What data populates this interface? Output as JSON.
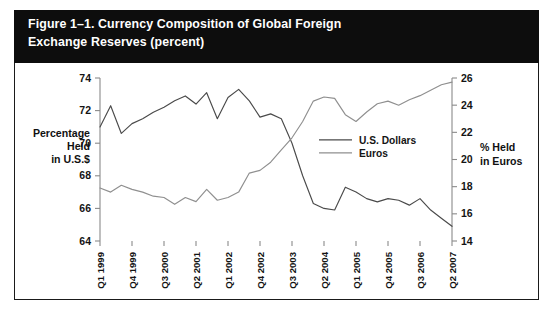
{
  "figure": {
    "title_line1": "Figure 1–1. Currency Composition of Global Foreign",
    "title_line2": "Exchange Reserves (percent)",
    "title_bg": "#0d0d0d",
    "title_color": "#ffffff"
  },
  "axis_titles": {
    "left_line1": "Percentage",
    "left_line2": "Held",
    "left_line3": "in U.S.$",
    "right_line1": "% Held",
    "right_line2": "in Euros"
  },
  "legend": {
    "items": [
      {
        "label": "U.S. Dollars",
        "color": "#4a4a4a"
      },
      {
        "label": "Euros",
        "color": "#8f8f8f"
      }
    ]
  },
  "chart_data": {
    "type": "line",
    "title": "Figure 1–1. Currency Composition of Global Foreign Exchange Reserves (percent)",
    "xlabel": "",
    "ylabel": "Percentage Held in U.S.$",
    "y2label": "% Held in Euros",
    "grid": false,
    "legend_position": "center",
    "ylim": [
      64,
      74
    ],
    "y2lim": [
      14,
      26
    ],
    "yticks": [
      64,
      66,
      68,
      70,
      72,
      74
    ],
    "y2ticks": [
      14,
      16,
      18,
      20,
      22,
      24,
      26
    ],
    "x": [
      "Q1 1999",
      "Q2 1999",
      "Q3 1999",
      "Q4 1999",
      "Q1 2000",
      "Q2 2000",
      "Q3 2000",
      "Q4 2000",
      "Q1 2001",
      "Q2 2001",
      "Q3 2001",
      "Q4 2001",
      "Q1 2002",
      "Q2 2002",
      "Q3 2002",
      "Q4 2002",
      "Q1 2003",
      "Q2 2003",
      "Q3 2003",
      "Q4 2003",
      "Q1 2004",
      "Q2 2004",
      "Q3 2004",
      "Q4 2004",
      "Q1 2005",
      "Q2 2005",
      "Q3 2005",
      "Q4 2005",
      "Q1 2006",
      "Q2 2006",
      "Q3 2006",
      "Q4 2006",
      "Q1 2007",
      "Q2 2007"
    ],
    "xtick_labels": [
      "Q1 1999",
      "Q4 1999",
      "Q3 2000",
      "Q2 2001",
      "Q1 2002",
      "Q4 2002",
      "Q3 2003",
      "Q2 2004",
      "Q1 2005",
      "Q4 2005",
      "Q3 2006",
      "Q2 2007"
    ],
    "xtick_indices": [
      0,
      3,
      6,
      9,
      12,
      15,
      18,
      21,
      24,
      27,
      30,
      33
    ],
    "series": [
      {
        "name": "U.S. Dollars",
        "axis": "left",
        "color": "#4a4a4a",
        "values": [
          71.0,
          72.3,
          70.6,
          71.2,
          71.5,
          71.9,
          72.2,
          72.6,
          72.9,
          72.4,
          73.1,
          71.5,
          72.8,
          73.3,
          72.6,
          71.6,
          71.8,
          71.5,
          70.0,
          68.0,
          66.3,
          66.0,
          65.9,
          67.3,
          67.0,
          66.6,
          66.4,
          66.6,
          66.5,
          66.2,
          66.6,
          65.9,
          65.4,
          64.9
        ]
      },
      {
        "name": "Euros",
        "axis": "right",
        "color": "#8f8f8f",
        "values": [
          17.9,
          17.6,
          18.1,
          17.8,
          17.6,
          17.3,
          17.2,
          16.7,
          17.2,
          16.9,
          17.8,
          17.0,
          17.2,
          17.6,
          19.0,
          19.2,
          19.8,
          20.7,
          21.6,
          22.8,
          24.3,
          24.6,
          24.5,
          23.3,
          22.8,
          23.5,
          24.1,
          24.3,
          24.0,
          24.4,
          24.7,
          25.1,
          25.5,
          25.7
        ]
      }
    ]
  }
}
